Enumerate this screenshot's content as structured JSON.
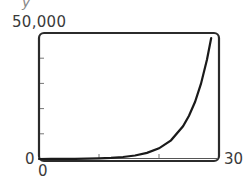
{
  "labels": {
    "top_fragment": "y",
    "y_max": "50,000",
    "y_min": "0",
    "x_min": "0",
    "x_max": "30"
  },
  "colors": {
    "frame": "#2b2b2b",
    "curve": "#1a1a1a",
    "ticks": "#777777",
    "background": "#ffffff"
  },
  "chart_data": {
    "type": "line",
    "title": "",
    "xlabel": "",
    "ylabel": "",
    "xlim": [
      0,
      30
    ],
    "ylim": [
      0,
      50000
    ],
    "x_ticks": [
      0,
      10,
      20,
      30
    ],
    "y_ticks": [
      0,
      10000,
      20000,
      30000,
      40000,
      50000
    ],
    "tick_labels": {
      "x": [
        "0",
        "30"
      ],
      "y": [
        "0",
        "50,000"
      ]
    },
    "grid": false,
    "legend": null,
    "series": [
      {
        "name": "exponential growth",
        "x": [
          0,
          2,
          4,
          6,
          8,
          10,
          12,
          14,
          16,
          18,
          20,
          22,
          24,
          25,
          26,
          27,
          28,
          28.7
        ],
        "values": [
          16,
          28,
          49,
          86,
          151,
          263,
          459,
          801,
          1398,
          2440,
          4258,
          7430,
          12966,
          17130,
          22630,
          29900,
          39500,
          48000
        ]
      }
    ]
  }
}
